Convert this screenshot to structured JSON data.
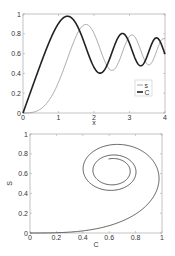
{
  "chart_data": [
    {
      "type": "line",
      "title": "",
      "xlabel": "x",
      "ylabel": "",
      "xlim": [
        0,
        4
      ],
      "ylim": [
        0,
        1
      ],
      "xticks": [
        "0",
        "1",
        "2",
        "3",
        "4"
      ],
      "yticks": [
        "0",
        "0.2",
        "0.4",
        "0.6",
        "0.8",
        "1"
      ],
      "grid": false,
      "legend_position": "inside lower right",
      "x": [
        0,
        0.25,
        0.5,
        0.75,
        1.0,
        1.25,
        1.5,
        1.75,
        2.0,
        2.25,
        2.5,
        2.75,
        3.0,
        3.25,
        3.5,
        3.75,
        4.0
      ],
      "series": [
        {
          "name": "S",
          "color": "#8a8a8a",
          "width": 0.8,
          "formula": "integral_0^x sin(t^2) dt",
          "values": [
            0,
            0.005,
            0.041,
            0.137,
            0.31,
            0.532,
            0.737,
            0.883,
            0.805,
            0.555,
            0.46,
            0.6,
            0.774,
            0.725,
            0.535,
            0.524,
            0.747
          ]
        },
        {
          "name": "C",
          "color": "#222222",
          "width": 1.6,
          "formula": "integral_0^x cos(t^2) dt",
          "values": [
            0,
            0.25,
            0.497,
            0.723,
            0.905,
            0.977,
            0.867,
            0.623,
            0.462,
            0.552,
            0.739,
            0.796,
            0.702,
            0.544,
            0.542,
            0.674,
            0.594
          ]
        }
      ]
    },
    {
      "type": "line",
      "title": "",
      "xlabel": "C",
      "ylabel": "S",
      "xlim": [
        0,
        1
      ],
      "ylim": [
        0,
        1
      ],
      "xticks": [
        "0",
        "0.2",
        "0.4",
        "0.6",
        "0.8",
        "1"
      ],
      "yticks": [
        "0",
        "0.2",
        "0.4",
        "0.6",
        "0.8",
        "1"
      ],
      "grid": false,
      "description": "Parametric curve (C(x), S(x)) for x in [0,4], spiraling toward (0.627, 0.627)",
      "x": [
        0,
        0.25,
        0.497,
        0.723,
        0.905,
        0.977,
        0.867,
        0.623,
        0.462,
        0.552,
        0.739,
        0.796,
        0.702,
        0.544,
        0.542,
        0.674,
        0.594
      ],
      "series": [
        {
          "name": "S vs C",
          "color": "#333333",
          "width": 0.8,
          "values": [
            0,
            0.005,
            0.041,
            0.137,
            0.31,
            0.532,
            0.737,
            0.883,
            0.805,
            0.555,
            0.46,
            0.6,
            0.774,
            0.725,
            0.535,
            0.524,
            0.747
          ]
        }
      ]
    }
  ],
  "legend": {
    "items": [
      "s",
      "C"
    ]
  },
  "axes": {
    "top": {
      "xlabel": "x"
    },
    "bottom": {
      "xlabel": "C",
      "ylabel": "S"
    }
  }
}
